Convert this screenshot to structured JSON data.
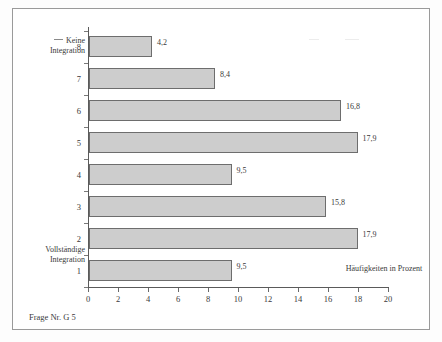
{
  "figure": {
    "source_note": "Frage Nr. G 5",
    "annotation_top": "Keine Integration",
    "annotation_bottom": "Vollständige Integration"
  },
  "chart_data": {
    "type": "bar",
    "orientation": "horizontal",
    "title": "",
    "xlabel": "Häufigkeiten in Prozent",
    "ylabel": "",
    "xlim": [
      0,
      20
    ],
    "xticks": [
      "0",
      "2",
      "4",
      "6",
      "8",
      "10",
      "12",
      "14",
      "16",
      "18",
      "20"
    ],
    "grid": false,
    "legend": "none",
    "bar_color": "#cdcdcd",
    "bar_border_color": "#6d6d6d",
    "categories": [
      "8",
      "7",
      "6",
      "5",
      "4",
      "3",
      "2",
      "1"
    ],
    "values": [
      4.2,
      8.4,
      16.8,
      17.9,
      9.5,
      15.8,
      17.9,
      9.5
    ],
    "value_labels": [
      "4,2",
      "8,4",
      "16,8",
      "17,9",
      "9,5",
      "15,8",
      "17,9",
      "9,5"
    ],
    "scale_endpoints": {
      "high_label": "Keine Integration",
      "low_label": "Vollständige Integration"
    }
  }
}
